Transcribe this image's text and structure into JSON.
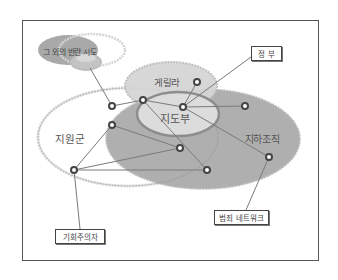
{
  "diagram": {
    "type": "network-venn",
    "sets": [
      {
        "id": "other_rebellions",
        "label": "그 외의 반란 시도"
      },
      {
        "id": "guerrilla",
        "label": "게릴라"
      },
      {
        "id": "leadership",
        "label": "지도부"
      },
      {
        "id": "supporters",
        "label": "지원군"
      },
      {
        "id": "underground",
        "label": "지하조직"
      }
    ],
    "callouts": [
      {
        "id": "government",
        "label": "정 부"
      },
      {
        "id": "criminal_network",
        "label": "범죄 네트워크"
      },
      {
        "id": "opportunists",
        "label": "기회주의자"
      }
    ],
    "colors": {
      "frame": "#555555",
      "dark_fill": "#a9a9a9",
      "light_fill": "#d9d9d9",
      "light_outline": "#d0d0d0",
      "node": "#444444",
      "edge": "#7a7a7a"
    }
  }
}
